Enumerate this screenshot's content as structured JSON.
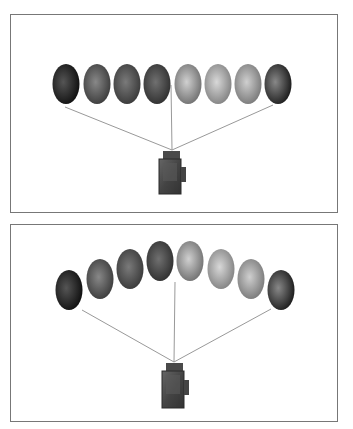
{
  "figure": {
    "panels": [
      {
        "id": "straight-row",
        "arrangement": "straight",
        "egg_count": 8,
        "egg_shades": [
          "#2a2a2a",
          "#555555",
          "#5a5a5a",
          "#4a4a4a",
          "#9a9a9a",
          "#a8a8a8",
          "#9e9e9e",
          "#4c4c4c"
        ],
        "camera": "camera-icon"
      },
      {
        "id": "arc-row",
        "arrangement": "arc",
        "egg_count": 8,
        "egg_shades": [
          "#2a2a2a",
          "#555555",
          "#5a5a5a",
          "#4a4a4a",
          "#9a9a9a",
          "#a8a8a8",
          "#9e9e9e",
          "#4c4c4c"
        ],
        "camera": "camera-icon"
      }
    ],
    "line_color": "#999999",
    "border_color": "#777777"
  }
}
